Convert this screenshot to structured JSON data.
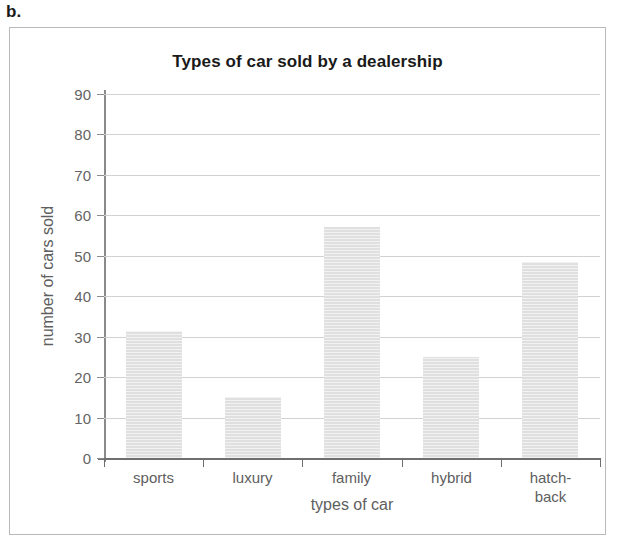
{
  "question_label": "b.",
  "chart_data": {
    "type": "bar",
    "title": "Types of car sold by a dealership",
    "xlabel": "types of car",
    "ylabel": "number of cars sold",
    "categories": [
      "sports",
      "luxury",
      "family",
      "hybrid",
      "hatch-\nback"
    ],
    "category_lines": [
      [
        "sports"
      ],
      [
        "luxury"
      ],
      [
        "family"
      ],
      [
        "hybrid"
      ],
      [
        "hatch-",
        "back"
      ]
    ],
    "values": [
      31.5,
      15,
      57,
      25,
      48.5
    ],
    "ylim": [
      0,
      90
    ],
    "ytick_step": 10,
    "yticks": [
      0,
      10,
      20,
      30,
      40,
      50,
      60,
      70,
      80,
      90
    ],
    "ytick_labels": [
      "0",
      "10",
      "20",
      "30",
      "40",
      "50",
      "60",
      "70",
      "80",
      "90"
    ],
    "grid": true,
    "grid_axis": "y",
    "legend": false,
    "bar_color": "#e3e3e3",
    "gridline_color": "#d2d2d2",
    "axis_color": "#6f6f6f",
    "text_color": "#5e5e5e",
    "title_color": "#1a1a1a"
  }
}
